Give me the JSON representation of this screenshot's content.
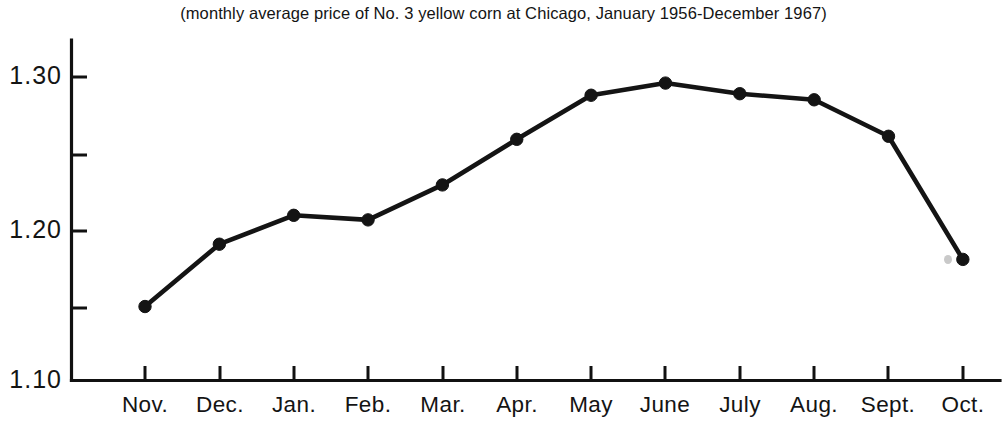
{
  "chart_data": {
    "type": "line",
    "title": "(monthly average price of No. 3 yellow corn at Chicago, January 1956-December 1967)",
    "xlabel": "",
    "ylabel": "",
    "categories": [
      "Nov.",
      "Dec.",
      "Jan.",
      "Feb.",
      "Mar.",
      "Apr.",
      "May",
      "June",
      "July",
      "Aug.",
      "Sept.",
      "Oct."
    ],
    "values": [
      1.149,
      1.19,
      1.209,
      1.206,
      1.229,
      1.259,
      1.288,
      1.296,
      1.289,
      1.285,
      1.261,
      1.18
    ],
    "series": [
      {
        "name": "Monthly average price",
        "values": [
          1.149,
          1.19,
          1.209,
          1.206,
          1.229,
          1.259,
          1.288,
          1.296,
          1.289,
          1.285,
          1.261,
          1.18
        ]
      }
    ],
    "ylim": [
      1.1,
      1.3
    ],
    "ytick_labels": [
      "1.30",
      "1.20",
      "1.10"
    ],
    "ytick_values": [
      1.3,
      1.2,
      1.1
    ],
    "yminor_tick_values": [
      1.25,
      1.15
    ],
    "grid": false,
    "legend": false,
    "legend_position": "none",
    "line_color": "#141414",
    "marker": "circle",
    "marker_color": "#141414",
    "background_color": "#ffffff",
    "axis_color": "#111111"
  },
  "axes": {
    "y_axis_label_top": "1.30",
    "y_axis_label_mid": "1.20",
    "y_axis_label_bottom": "1.10"
  },
  "x_labels": {
    "m0": "Nov.",
    "m1": "Dec.",
    "m2": "Jan.",
    "m3": "Feb.",
    "m4": "Mar.",
    "m5": "Apr.",
    "m6": "May",
    "m7": "June",
    "m8": "July",
    "m9": "Aug.",
    "m10": "Sept.",
    "m11": "Oct."
  }
}
